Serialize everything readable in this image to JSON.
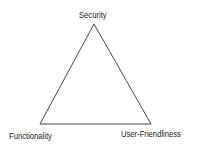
{
  "diagram": {
    "type": "triangle",
    "title": "",
    "vertices": [
      {
        "label": "Security",
        "position": "top"
      },
      {
        "label": "Functionality",
        "position": "bottom-left"
      },
      {
        "label": "User-Friendliness",
        "position": "bottom-right"
      }
    ],
    "line_color": "#333333",
    "text_color": "#222222"
  }
}
